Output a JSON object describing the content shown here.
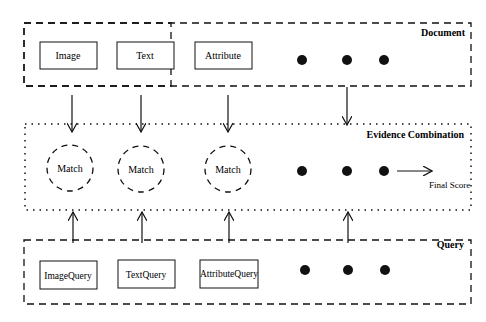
{
  "document_group": {
    "title": "Document",
    "boxes": [
      "Image",
      "Text",
      "Attribute"
    ]
  },
  "combination_group": {
    "title": "Evidence Combination",
    "nodes": [
      "Match",
      "Match",
      "Match"
    ]
  },
  "query_group": {
    "title": "Query",
    "boxes": [
      "ImageQuery",
      "TextQuery",
      "AttributeQuery"
    ]
  },
  "output": {
    "label": "Final Score"
  },
  "ellipsis_dots": 3
}
